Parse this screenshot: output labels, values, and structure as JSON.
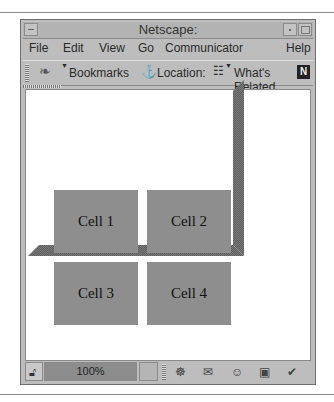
{
  "window": {
    "title": "Netscape:"
  },
  "menu": [
    "File",
    "Edit",
    "View",
    "Go",
    "Communicator",
    "Help"
  ],
  "toolbar": {
    "bookmarks": "Bookmarks",
    "location": "Location:",
    "whats_related": "What's Related",
    "netscape_logo": "N"
  },
  "content": {
    "cells": [
      "Cell 1",
      "Cell 2",
      "Cell 3",
      "Cell 4"
    ]
  },
  "statusbar": {
    "progress": "100%",
    "icons": [
      "security-lock-icon",
      "navigator-icon",
      "mail-icon",
      "discussion-icon",
      "composer-icon",
      "address-book-icon"
    ]
  },
  "colors": {
    "cell": "#8e8e8e",
    "frame": "#bdbdbd",
    "bevel": "#6f6f6f"
  }
}
